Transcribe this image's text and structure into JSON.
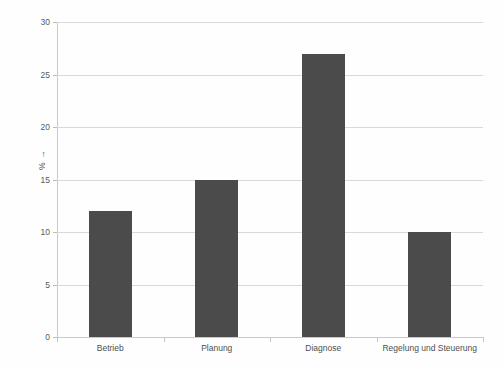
{
  "chart_data": {
    "type": "bar",
    "title": "",
    "xlabel": "",
    "ylabel": "% →",
    "categories": [
      "Betrieb",
      "Planung",
      "Diagnose",
      "Regelung und Steuerung"
    ],
    "values": [
      12,
      15,
      27,
      10
    ],
    "ylim": [
      0,
      30
    ],
    "ytick_labels": [
      "0",
      "5",
      "10",
      "15",
      "20",
      "25",
      "30"
    ],
    "ytick_values": [
      0,
      5,
      10,
      15,
      20,
      25,
      30
    ],
    "grid": true,
    "legend": false,
    "legend_position": "none",
    "colors": {
      "bar": "#4b4b4b",
      "gridline": "#d9d9d9",
      "axis": "#c9c9c9",
      "tick_text": "#595959",
      "category_text": "#4f4f4f",
      "background": "#fefefe"
    }
  }
}
